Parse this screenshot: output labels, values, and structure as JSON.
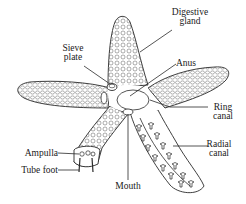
{
  "diagram": {
    "colors": {
      "outline": "#2a2a2a",
      "texture": "#5a5a5a",
      "background": "#ffffff"
    },
    "labels": {
      "digestive_gland": {
        "line1": "Digestive",
        "line2": "gland"
      },
      "sieve_plate": {
        "line1": "Sieve",
        "line2": "plate"
      },
      "anus": {
        "line1": "Anus"
      },
      "ring_canal": {
        "line1": "Ring",
        "line2": "canal"
      },
      "radial_canal": {
        "line1": "Radial",
        "line2": "canal"
      },
      "ampulla": {
        "line1": "Ampulla"
      },
      "tube_foot": {
        "line1": "Tube foot"
      },
      "mouth": {
        "line1": "Mouth"
      }
    }
  }
}
